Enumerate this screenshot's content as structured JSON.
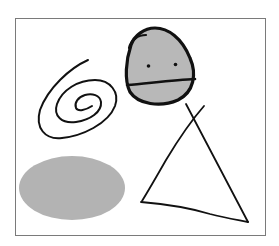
{
  "drawing": {
    "frame": {
      "stroke": "#7a7a7a"
    },
    "shapes": [
      {
        "type": "face",
        "fill": "#b8b8b8",
        "stroke": "#111111"
      },
      {
        "type": "spiral",
        "stroke": "#111111"
      },
      {
        "type": "ellipse",
        "fill": "#b3b3b3"
      },
      {
        "type": "triangle",
        "stroke": "#111111"
      }
    ]
  }
}
